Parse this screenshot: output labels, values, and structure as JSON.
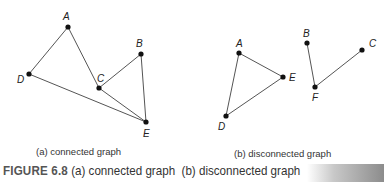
{
  "graph_a": {
    "subcaption": "(a) connected graph",
    "nodes": [
      {
        "id": "A",
        "x": 68,
        "y": 27,
        "lx": 63,
        "ly": 20
      },
      {
        "id": "B",
        "x": 141,
        "y": 54,
        "lx": 136,
        "ly": 47
      },
      {
        "id": "C",
        "x": 99,
        "y": 88,
        "lx": 97,
        "ly": 82
      },
      {
        "id": "D",
        "x": 29,
        "y": 74,
        "lx": 17,
        "ly": 83
      },
      {
        "id": "E",
        "x": 146,
        "y": 122,
        "lx": 143,
        "ly": 137
      }
    ],
    "edges": [
      [
        "A",
        "D"
      ],
      [
        "A",
        "C"
      ],
      [
        "C",
        "B"
      ],
      [
        "B",
        "E"
      ],
      [
        "C",
        "E"
      ],
      [
        "D",
        "E"
      ]
    ]
  },
  "graph_b": {
    "subcaption": "(b) disconnected graph",
    "nodes": [
      {
        "id": "A",
        "x": 239,
        "y": 53,
        "lx": 236,
        "ly": 47
      },
      {
        "id": "E",
        "x": 283,
        "y": 77,
        "lx": 289,
        "ly": 81
      },
      {
        "id": "D",
        "x": 226,
        "y": 116,
        "lx": 218,
        "ly": 130
      },
      {
        "id": "B",
        "x": 307,
        "y": 43,
        "lx": 303,
        "ly": 37
      },
      {
        "id": "F",
        "x": 315,
        "y": 87,
        "lx": 312,
        "ly": 101
      },
      {
        "id": "C",
        "x": 362,
        "y": 50,
        "lx": 369,
        "ly": 47
      }
    ],
    "edges": [
      [
        "A",
        "E"
      ],
      [
        "A",
        "D"
      ],
      [
        "D",
        "E"
      ],
      [
        "B",
        "F"
      ],
      [
        "F",
        "C"
      ]
    ]
  },
  "caption": {
    "figure_label": "FIGURE 6.8",
    "text": " (a) connected graph  (b) disconnected graph"
  },
  "colors": {
    "edge": "#555555",
    "node": "#111111"
  }
}
